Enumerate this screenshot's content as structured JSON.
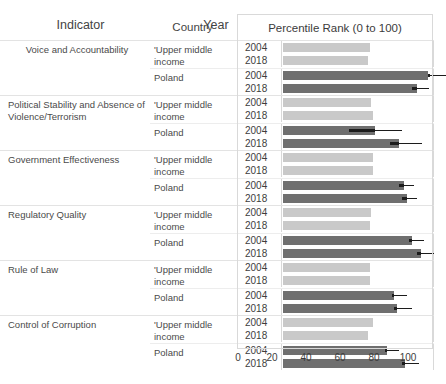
{
  "header": {
    "indicator": "Indicator",
    "country": "Country",
    "year": "Year",
    "percentile": "Percentile Rank (0 to 100)"
  },
  "axis": {
    "ticks": [
      "0",
      "20",
      "40",
      "60",
      "80",
      "100"
    ],
    "min": 0,
    "max": 100
  },
  "colors": {
    "bar_upper_middle_income": "#c9c9c9",
    "bar_poland": "#6f6f6f",
    "error_bar": "#1c1c1c",
    "grid": "#d9d9d9",
    "text": "#3d3d3d"
  },
  "chart_data": {
    "type": "bar",
    "title": "Percentile Rank (0 to 100)",
    "xlabel": "Percentile Rank (0 to 100)",
    "ylabel": "",
    "xlim": [
      0,
      100
    ],
    "grid": false,
    "legend": "none",
    "orientation": "horizontal",
    "categories": [
      "Voice and Accountability",
      "Political Stability and Absence of Violence/Terrorism",
      "Government Effectiveness",
      "Regulatory Quality",
      "Rule of Law",
      "Control of Corruption"
    ],
    "groups": [
      {
        "indicator": "Voice and Accountability",
        "countries": [
          {
            "country": "'Upper middle income",
            "series": "upper-middle-income",
            "rows": [
              {
                "year": "2004",
                "value": 51,
                "err_low": null,
                "err_high": null
              },
              {
                "year": "2018",
                "value": 50,
                "err_low": null,
                "err_high": null
              }
            ]
          },
          {
            "country": "Poland",
            "series": "poland",
            "rows": [
              {
                "year": "2004",
                "value": 85,
                "err_low": 85,
                "err_high": 96
              },
              {
                "year": "2018",
                "value": 79,
                "err_low": 76,
                "err_high": 86
              }
            ]
          }
        ]
      },
      {
        "indicator": "Political Stability and Absence of Violence/Terrorism",
        "countries": [
          {
            "country": "'Upper middle income",
            "series": "upper-middle-income",
            "rows": [
              {
                "year": "2004",
                "value": 52,
                "err_low": null,
                "err_high": null
              },
              {
                "year": "2018",
                "value": 53,
                "err_low": null,
                "err_high": null
              }
            ]
          },
          {
            "country": "Poland",
            "series": "poland",
            "rows": [
              {
                "year": "2004",
                "value": 54,
                "err_low": 39,
                "err_high": 70
              },
              {
                "year": "2018",
                "value": 68,
                "err_low": 63,
                "err_high": 82
              }
            ]
          }
        ]
      },
      {
        "indicator": "Government Effectiveness",
        "countries": [
          {
            "country": "'Upper middle income",
            "series": "upper-middle-income",
            "rows": [
              {
                "year": "2004",
                "value": 53,
                "err_low": null,
                "err_high": null
              },
              {
                "year": "2018",
                "value": 53,
                "err_low": null,
                "err_high": null
              }
            ]
          },
          {
            "country": "Poland",
            "series": "poland",
            "rows": [
              {
                "year": "2004",
                "value": 71,
                "err_low": 68,
                "err_high": 77
              },
              {
                "year": "2018",
                "value": 73,
                "err_low": 70,
                "err_high": 79
              }
            ]
          }
        ]
      },
      {
        "indicator": "Regulatory Quality",
        "countries": [
          {
            "country": "'Upper middle income",
            "series": "upper-middle-income",
            "rows": [
              {
                "year": "2004",
                "value": 52,
                "err_low": null,
                "err_high": null
              },
              {
                "year": "2018",
                "value": 51,
                "err_low": null,
                "err_high": null
              }
            ]
          },
          {
            "country": "Poland",
            "series": "poland",
            "rows": [
              {
                "year": "2004",
                "value": 76,
                "err_low": 74,
                "err_high": 83
              },
              {
                "year": "2018",
                "value": 81,
                "err_low": 79,
                "err_high": 89
              }
            ]
          }
        ]
      },
      {
        "indicator": "Rule of Law",
        "countries": [
          {
            "country": "'Upper middle income",
            "series": "upper-middle-income",
            "rows": [
              {
                "year": "2004",
                "value": 51,
                "err_low": null,
                "err_high": null
              },
              {
                "year": "2018",
                "value": 51,
                "err_low": null,
                "err_high": null
              }
            ]
          },
          {
            "country": "Poland",
            "series": "poland",
            "rows": [
              {
                "year": "2004",
                "value": 65,
                "err_low": 64,
                "err_high": 73
              },
              {
                "year": "2018",
                "value": 67,
                "err_low": 65,
                "err_high": 76
              }
            ]
          }
        ]
      },
      {
        "indicator": "Control of Corruption",
        "countries": [
          {
            "country": "'Upper middle income",
            "series": "upper-middle-income",
            "rows": [
              {
                "year": "2004",
                "value": 53,
                "err_low": null,
                "err_high": null
              },
              {
                "year": "2018",
                "value": 50,
                "err_low": null,
                "err_high": null
              }
            ]
          },
          {
            "country": "Poland",
            "series": "poland",
            "rows": [
              {
                "year": "2004",
                "value": 61,
                "err_low": 60,
                "err_high": 68
              },
              {
                "year": "2018",
                "value": 72,
                "err_low": 70,
                "err_high": 80
              }
            ]
          }
        ]
      }
    ]
  }
}
